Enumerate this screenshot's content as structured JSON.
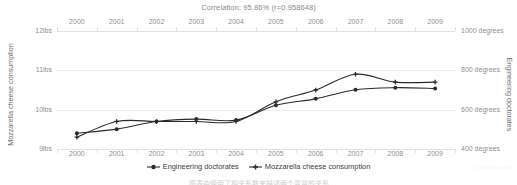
{
  "chart_data": {
    "type": "line",
    "title": "Correlation: 95.86% (r=0.958648)",
    "xlabel": "",
    "grid": true,
    "legend_position": "bottom-center",
    "x": [
      2000,
      2001,
      2002,
      2003,
      2004,
      2005,
      2006,
      2007,
      2008,
      2009
    ],
    "xtick_labels": [
      "2000",
      "2001",
      "2002",
      "2003",
      "2004",
      "2005",
      "2006",
      "2007",
      "2008",
      "2009"
    ],
    "xaxis_top_labels": [
      "2000",
      "2001",
      "2002",
      "2003",
      "2004",
      "2005",
      "2006",
      "2007",
      "2008",
      "2009"
    ],
    "series": [
      {
        "name": "Engineering doctorates",
        "axis": "right",
        "unit": "degrees",
        "marker": "circle",
        "color": "#2b2b2b",
        "values": [
          480,
          501,
          540,
          552,
          547,
          622,
          655,
          701,
          712,
          708
        ]
      },
      {
        "name": "Mozzarella cheese consumption",
        "axis": "left",
        "unit": "lbs",
        "marker": "plus",
        "color": "#2b2b2b",
        "values": [
          9.3,
          9.7,
          9.7,
          9.7,
          9.7,
          10.2,
          10.5,
          10.9,
          10.7,
          10.7
        ]
      }
    ],
    "yaxis_left": {
      "label": "Mozzarella cheese consumption",
      "ticks": [
        12,
        11,
        10,
        9
      ],
      "tick_labels": [
        "12lbs",
        "11lbs",
        "10lbs",
        "9lbs"
      ],
      "ylim": [
        9,
        12
      ]
    },
    "yaxis_right": {
      "label": "Engineering doctorates",
      "ticks": [
        1000,
        800,
        600,
        400
      ],
      "tick_labels": [
        "1000 degrees",
        "800 degrees",
        "600 degrees",
        "400 degrees"
      ],
      "ylim": [
        400,
        1000
      ]
    }
  },
  "legend": {
    "items": [
      {
        "label": "Engineering doctorates",
        "marker": "circle-marker"
      },
      {
        "label": "Mozzarella cheese consumption",
        "marker": "plus-marker"
      }
    ]
  },
  "watermark": {
    "text": "tylervigen.com"
  },
  "caption": {
    "text": "图表中使用了相关系数来描述两个变量的关系"
  },
  "colors": {
    "line": "#2b2b2b",
    "grid": "#ececec",
    "tick_text": "#8f8f8f",
    "title_text": "#8a8a8a",
    "axis_title_text": "#6e6e6e"
  }
}
